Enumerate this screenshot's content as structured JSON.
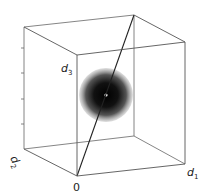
{
  "diagram": {
    "type": "3d-cube-with-sphere",
    "labels": {
      "origin": "0",
      "axis1": "d",
      "axis1_sub": "1",
      "axis2": "d",
      "axis2_sub": "2",
      "axis3": "d",
      "axis3_sub": "3"
    },
    "colors": {
      "edge": "#555555",
      "diagonal": "#222222",
      "sphere_core": "#000000",
      "sphere_edge": "#bbbbbb",
      "center_dot": "#ffffff"
    }
  }
}
